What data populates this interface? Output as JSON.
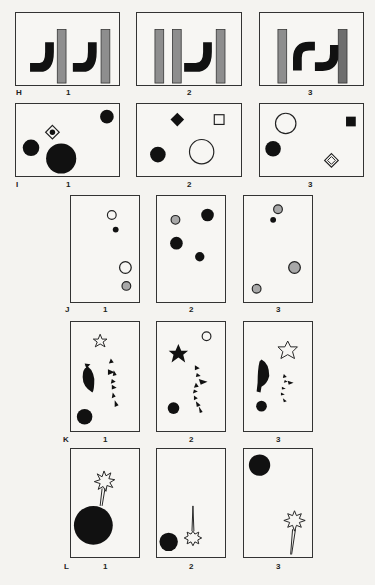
{
  "page": {
    "page_number_fragment": ""
  },
  "colors": {
    "black": "#111111",
    "gray_bar": "#8e8e8e",
    "gray_fill": "#a8a8a8",
    "white": "#f7f6f3",
    "stroke": "#222222"
  },
  "rows": [
    {
      "letter": "H",
      "panels": [
        {
          "number": "1",
          "description": "two black J-shaped hooks each followed by a gray vertical bar"
        },
        {
          "number": "2",
          "description": "two gray vertical bars, a black J hook, then a gray vertical bar"
        },
        {
          "number": "3",
          "description": "gray bar, two interlocking black hooks forming an S shape, gray bar"
        }
      ]
    },
    {
      "letter": "I",
      "panels": [
        {
          "number": "1",
          "description": "small black circle top-right, diamond with dot, medium black circle left, large black circle bottom"
        },
        {
          "number": "2",
          "description": "black diamond, small open square, black circle, large open circle"
        },
        {
          "number": "3",
          "description": "open circle, black square, black circle, nested diamond"
        }
      ]
    },
    {
      "letter": "J",
      "panels": [
        {
          "number": "1",
          "description": "open circle, small black dot, larger open circle, gray circle"
        },
        {
          "number": "2",
          "description": "gray circle, large black circle, large black circle, medium black circle"
        },
        {
          "number": "3",
          "description": "gray circle, small black dot, large gray circle, gray circle"
        }
      ]
    },
    {
      "letter": "K",
      "panels": [
        {
          "number": "1",
          "description": "open star, black half-moon, zigzag chain of triangles, black circle"
        },
        {
          "number": "2",
          "description": "black star, open small circle, zigzag chain, black circle"
        },
        {
          "number": "3",
          "description": "open star, black half-moon, small zigzag chain, small black circle"
        }
      ]
    },
    {
      "letter": "L",
      "panels": [
        {
          "number": "1",
          "description": "large black bomb with fuse ending in spark burst"
        },
        {
          "number": "2",
          "description": "small black circle, spark burst with upward line"
        },
        {
          "number": "3",
          "description": "black circle top-left, spark burst with line going down"
        }
      ]
    }
  ]
}
